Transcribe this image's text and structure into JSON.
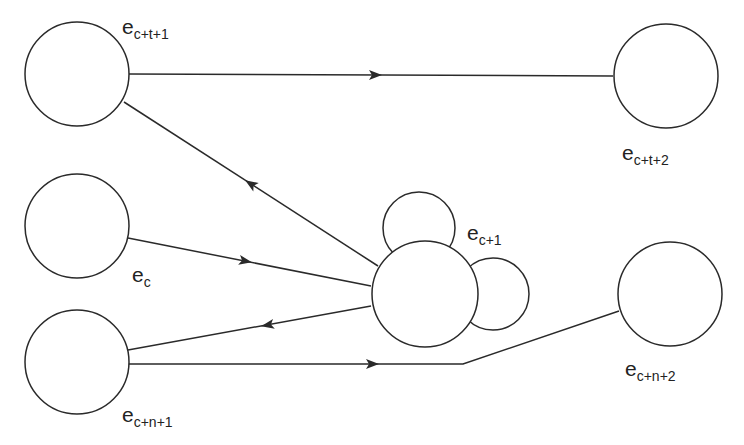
{
  "diagram": {
    "type": "state-transition-graph",
    "colors": {
      "stroke": "#2a2a2a",
      "background": "#ffffff",
      "text": "#222222"
    },
    "nodes": [
      {
        "id": "e_c+t+1",
        "label_base": "e",
        "label_sub": "c+t+1",
        "cx": 77,
        "cy": 74,
        "r": 52,
        "lx": 122,
        "ly": 34
      },
      {
        "id": "e_c+t+2",
        "label_base": "e",
        "label_sub": "c+t+2",
        "cx": 666,
        "cy": 76,
        "r": 52,
        "lx": 622,
        "ly": 160
      },
      {
        "id": "e_c",
        "label_base": "e",
        "label_sub": "c",
        "cx": 77,
        "cy": 226,
        "r": 52,
        "lx": 132,
        "ly": 282
      },
      {
        "id": "e_c+n+1",
        "label_base": "e",
        "label_sub": "c+n+1",
        "cx": 77,
        "cy": 362,
        "r": 52,
        "lx": 122,
        "ly": 422
      },
      {
        "id": "e_c+n+2",
        "label_base": "e",
        "label_sub": "c+n+2",
        "cx": 670,
        "cy": 294,
        "r": 52,
        "lx": 625,
        "ly": 376
      },
      {
        "id": "e_c+1",
        "label_base": "e",
        "label_sub": "c+1",
        "cx": 425,
        "cy": 294,
        "r": 53,
        "lx": 467,
        "ly": 240
      }
    ],
    "self_loops": [
      {
        "of": "e_c+1",
        "cx": 419,
        "cy": 228,
        "r": 36
      },
      {
        "of": "e_c+1",
        "cx": 493,
        "cy": 294,
        "r": 36
      }
    ],
    "edges": [
      {
        "from": "e_c+t+1",
        "to": "e_c+t+2",
        "points": "129,74 613,76",
        "arrow": {
          "x": 375,
          "y": 75,
          "angle": 0
        }
      },
      {
        "from": "e_c+1",
        "to": "e_c+t+1",
        "points": "124,102 378,266",
        "arrow": {
          "x": 251,
          "y": 184,
          "angle": 212.9
        }
      },
      {
        "from": "e_c",
        "to": "e_c+1",
        "points": "128,238 371,286",
        "arrow": {
          "x": 245,
          "y": 261,
          "angle": 11.2
        }
      },
      {
        "from": "e_c+1",
        "to": "e_c+n+1",
        "points": "371,306 128,350",
        "arrow": {
          "x": 268,
          "y": 325,
          "angle": 169.7
        }
      },
      {
        "from": "e_c+n+1",
        "to": "e_c+n+2",
        "points": "128,364 463,364 619,311",
        "arrow": {
          "x": 372,
          "y": 364,
          "angle": 0
        }
      }
    ]
  }
}
